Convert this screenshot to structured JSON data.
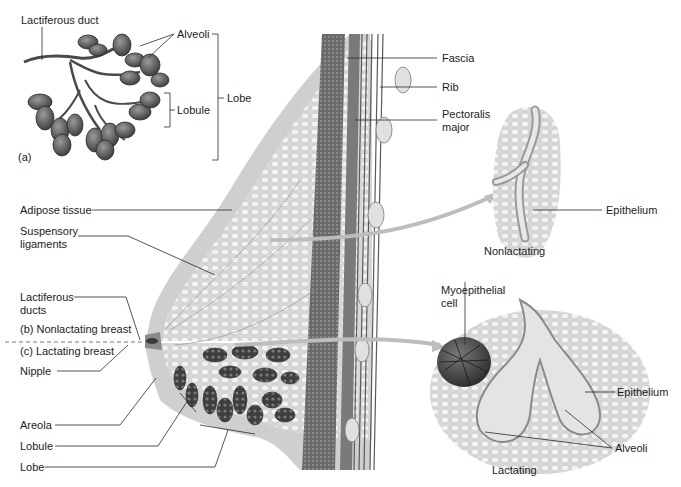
{
  "figure": {
    "panel_a": {
      "marker": "(a)",
      "labels": {
        "lactiferous_duct": "Lactiferous duct",
        "alveoli": "Alveoli",
        "lobule": "Lobule",
        "lobe": "Lobe"
      }
    },
    "chest_wall": {
      "fascia": "Fascia",
      "rib": "Rib",
      "pectoralis_major_line1": "Pectoralis",
      "pectoralis_major_line2": "major"
    },
    "breast_left_labels": {
      "adipose_tissue": "Adipose tissue",
      "suspensory_ligaments_line1": "Suspensory",
      "suspensory_ligaments_line2": "ligaments",
      "lactiferous_ducts_line1": "Lactiferous",
      "lactiferous_ducts_line2": "ducts",
      "nonlactating_breast": "(b)  Nonlactating breast",
      "lactating_breast": "(c)  Lactating breast",
      "nipple": "Nipple",
      "areola": "Areola",
      "lobule": "Lobule",
      "lobe": "Lobe"
    },
    "nonlactating_inset": {
      "epithelium": "Epithelium",
      "caption": "Nonlactating"
    },
    "lactating_inset": {
      "myoepithelial_line1": "Myoepithelial",
      "myoepithelial_line2": "cell",
      "epithelium": "Epithelium",
      "alveoli": "Alveoli",
      "caption": "Lactating"
    },
    "colors": {
      "line": "#2a2a2a",
      "skin": "#cfcfcf",
      "adipose": "#e6e6e6",
      "muscle": "#6d6d6d",
      "lobule_dark": "#4a4a4a",
      "arrow": "#b9b9b9"
    }
  }
}
